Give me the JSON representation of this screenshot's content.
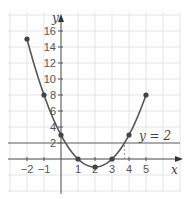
{
  "chart_data": {
    "type": "line",
    "title": "",
    "xlabel": "x",
    "ylabel": "y",
    "x": [
      -2,
      -1,
      0,
      1,
      2,
      3,
      4,
      5
    ],
    "series": [
      {
        "name": "y = x^2 - 4x + 3",
        "values": [
          15,
          8,
          3,
          0,
          -1,
          0,
          3,
          8
        ]
      }
    ],
    "reference_lines": [
      {
        "type": "horizontal",
        "y": 2,
        "label": "y = 2"
      }
    ],
    "annotations": [
      {
        "type": "dashed-vertical",
        "x": 3.73,
        "from_y": 0,
        "to_y": 2
      }
    ],
    "x_ticks": [
      "-2",
      "-1",
      "1",
      "2",
      "3",
      "4",
      "5"
    ],
    "y_ticks": [
      "2",
      "4",
      "6",
      "8",
      "10",
      "12",
      "14",
      "16"
    ],
    "xlim": [
      -2.9,
      6.5
    ],
    "ylim": [
      -3,
      18
    ],
    "grid": true,
    "legend": "none"
  },
  "labels": {
    "x_axis": "x",
    "y_axis": "y",
    "hline": "y = 2"
  }
}
